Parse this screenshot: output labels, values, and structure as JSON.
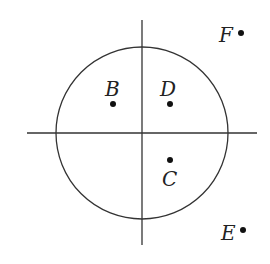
{
  "diagram": {
    "circle": {
      "cx": 142,
      "cy": 133,
      "r": 86
    },
    "axes": {
      "horizontal": {
        "x1": 27,
        "x2": 257,
        "y": 133
      },
      "vertical": {
        "x": 142,
        "y1": 20,
        "y2": 245
      }
    },
    "points": [
      {
        "label": "B",
        "x": 113,
        "y": 104,
        "lx": 105,
        "ly": 96
      },
      {
        "label": "D",
        "x": 170,
        "y": 104,
        "lx": 160,
        "ly": 96
      },
      {
        "label": "C",
        "x": 170,
        "y": 160,
        "lx": 162,
        "ly": 186
      },
      {
        "label": "F",
        "x": 241,
        "y": 33,
        "lx": 219,
        "ly": 42
      },
      {
        "label": "E",
        "x": 243,
        "y": 230,
        "lx": 221,
        "ly": 240
      }
    ],
    "colors": {
      "stroke": "#333333",
      "point": "#111111"
    }
  }
}
